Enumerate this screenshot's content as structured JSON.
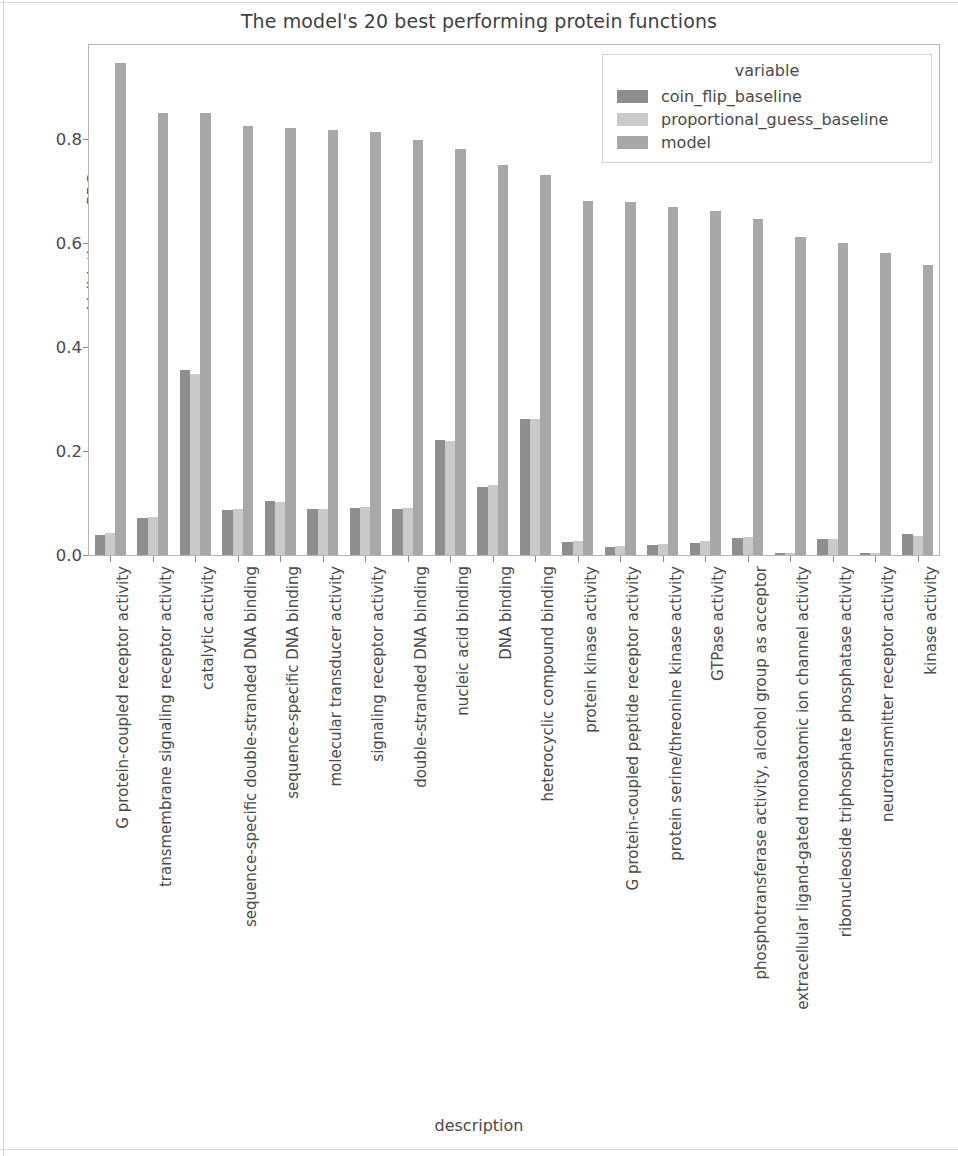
{
  "chart_data": {
    "type": "bar",
    "title": "The model's 20 best performing protein functions",
    "xlabel": "description",
    "ylabel": "Validation auPRC",
    "ylim": [
      0.0,
      0.98
    ],
    "yticks": [
      "0.0",
      "0.2",
      "0.4",
      "0.6",
      "0.8"
    ],
    "ytick_values": [
      0.0,
      0.2,
      0.4,
      0.6,
      0.8
    ],
    "grid": false,
    "legend_title": "variable",
    "legend_position": "upper right",
    "categories": [
      "G protein-coupled receptor activity",
      "transmembrane signaling receptor activity",
      "catalytic activity",
      "sequence-specific double-stranded DNA binding",
      "sequence-specific DNA binding",
      "molecular transducer activity",
      "signaling receptor activity",
      "double-stranded DNA binding",
      "nucleic acid binding",
      "DNA binding",
      "heterocyclic compound binding",
      "protein kinase activity",
      "G protein-coupled peptide receptor activity",
      "protein serine/threonine kinase activity",
      "GTPase activity",
      "phosphotransferase activity, alcohol group as acceptor",
      "extracellular ligand-gated monoatomic ion channel activity",
      "ribonucleoside triphosphate phosphatase activity",
      "neurotransmitter receptor activity",
      "kinase activity"
    ],
    "series": [
      {
        "name": "coin_flip_baseline",
        "color": "#8e8e8e",
        "values": [
          0.039,
          0.071,
          0.355,
          0.087,
          0.103,
          0.088,
          0.091,
          0.089,
          0.221,
          0.13,
          0.262,
          0.025,
          0.016,
          0.02,
          0.024,
          0.033,
          0.004,
          0.03,
          0.004,
          0.04
        ]
      },
      {
        "name": "proportional_guess_baseline",
        "color": "#cacaca",
        "values": [
          0.043,
          0.073,
          0.348,
          0.089,
          0.101,
          0.089,
          0.092,
          0.091,
          0.22,
          0.134,
          0.261,
          0.026,
          0.018,
          0.021,
          0.027,
          0.034,
          0.004,
          0.031,
          0.004,
          0.037
        ]
      },
      {
        "name": "model",
        "color": "#a8a8a8",
        "values": [
          0.945,
          0.849,
          0.849,
          0.825,
          0.821,
          0.816,
          0.812,
          0.797,
          0.78,
          0.75,
          0.73,
          0.681,
          0.678,
          0.668,
          0.661,
          0.646,
          0.611,
          0.599,
          0.58,
          0.557
        ]
      }
    ]
  }
}
